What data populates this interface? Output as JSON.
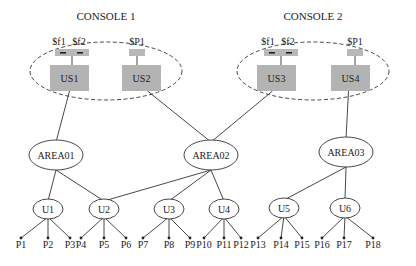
{
  "consoles": [
    {
      "id": "console1",
      "title": "CONSOLE 1",
      "cx": 106,
      "cy": 71,
      "rx": 76,
      "ry": 29,
      "tx": 106,
      "ty": 20
    },
    {
      "id": "console2",
      "title": "CONSOLE 2",
      "cx": 313,
      "cy": 71,
      "rx": 76,
      "ry": 29,
      "tx": 313,
      "ty": 20
    }
  ],
  "stations": [
    {
      "id": "US1",
      "label": "US1",
      "x": 50,
      "y": 65,
      "w": 39,
      "h": 26,
      "tags": [
        "$f1",
        "$f2"
      ],
      "tagx": 55,
      "tagw": 34
    },
    {
      "id": "US2",
      "label": "US2",
      "x": 122,
      "y": 65,
      "w": 39,
      "h": 26,
      "tags": [
        "$P1"
      ],
      "tagx": 129,
      "tagw": 16
    },
    {
      "id": "US3",
      "label": "US3",
      "x": 257,
      "y": 65,
      "w": 39,
      "h": 26,
      "tags": [
        "$f1",
        "$f2"
      ],
      "tagx": 264,
      "tagw": 34
    },
    {
      "id": "US4",
      "label": "US4",
      "x": 331,
      "y": 65,
      "w": 39,
      "h": 26,
      "tags": [
        "$P1"
      ],
      "tagx": 347,
      "tagw": 16
    }
  ],
  "areas": [
    {
      "id": "AREA01",
      "label": "AREA01",
      "cx": 56,
      "cy": 155,
      "rx": 27,
      "ry": 15
    },
    {
      "id": "AREA02",
      "label": "AREA02",
      "cx": 211,
      "cy": 155,
      "rx": 27,
      "ry": 15
    },
    {
      "id": "AREA03",
      "label": "AREA03",
      "cx": 346,
      "cy": 152,
      "rx": 27,
      "ry": 15
    }
  ],
  "units": [
    {
      "id": "U1",
      "label": "U1",
      "cx": 48,
      "cy": 209
    },
    {
      "id": "U2",
      "label": "U2",
      "cx": 104,
      "cy": 209
    },
    {
      "id": "U3",
      "label": "U3",
      "cx": 169,
      "cy": 209
    },
    {
      "id": "U4",
      "label": "U4",
      "cx": 224,
      "cy": 209
    },
    {
      "id": "U5",
      "label": "U5",
      "cx": 284,
      "cy": 208
    },
    {
      "id": "U6",
      "label": "U6",
      "cx": 345,
      "cy": 208
    }
  ],
  "points": [
    {
      "label": "P1",
      "x": 21,
      "parent": "U1"
    },
    {
      "label": "P2",
      "x": 48,
      "parent": "U1"
    },
    {
      "label": "P3",
      "x": 70,
      "parent": "U1"
    },
    {
      "label": "P4",
      "x": 81,
      "parent": "U2"
    },
    {
      "label": "P5",
      "x": 104,
      "parent": "U2"
    },
    {
      "label": "P6",
      "x": 126,
      "parent": "U2"
    },
    {
      "label": "P7",
      "x": 143,
      "parent": "U3"
    },
    {
      "label": "P8",
      "x": 169,
      "parent": "U3"
    },
    {
      "label": "P9",
      "x": 190,
      "parent": "U3"
    },
    {
      "label": "P10",
      "x": 204,
      "parent": "U4"
    },
    {
      "label": "P11",
      "x": 224,
      "parent": "U4"
    },
    {
      "label": "P12",
      "x": 241,
      "parent": "U4"
    },
    {
      "label": "P13",
      "x": 258,
      "parent": "U5"
    },
    {
      "label": "P14",
      "x": 281,
      "parent": "U5"
    },
    {
      "label": "P15",
      "x": 302,
      "parent": "U5"
    },
    {
      "label": "P16",
      "x": 322,
      "parent": "U6"
    },
    {
      "label": "P17",
      "x": 344,
      "parent": "U6"
    },
    {
      "label": "P18",
      "x": 373,
      "parent": "U6"
    }
  ],
  "edges": [
    [
      "US1",
      "AREA01"
    ],
    [
      "US2",
      "AREA02"
    ],
    [
      "US3",
      "AREA02"
    ],
    [
      "US4",
      "AREA03"
    ],
    [
      "AREA01",
      "U1"
    ],
    [
      "AREA01",
      "U2"
    ],
    [
      "AREA02",
      "U2"
    ],
    [
      "AREA02",
      "U3"
    ],
    [
      "AREA02",
      "U4"
    ],
    [
      "AREA03",
      "U5"
    ],
    [
      "AREA03",
      "U6"
    ]
  ],
  "colors": {
    "box": "#b3b3b3",
    "tag": "#b8b8b8",
    "line": "#333333",
    "text": "#222222"
  }
}
